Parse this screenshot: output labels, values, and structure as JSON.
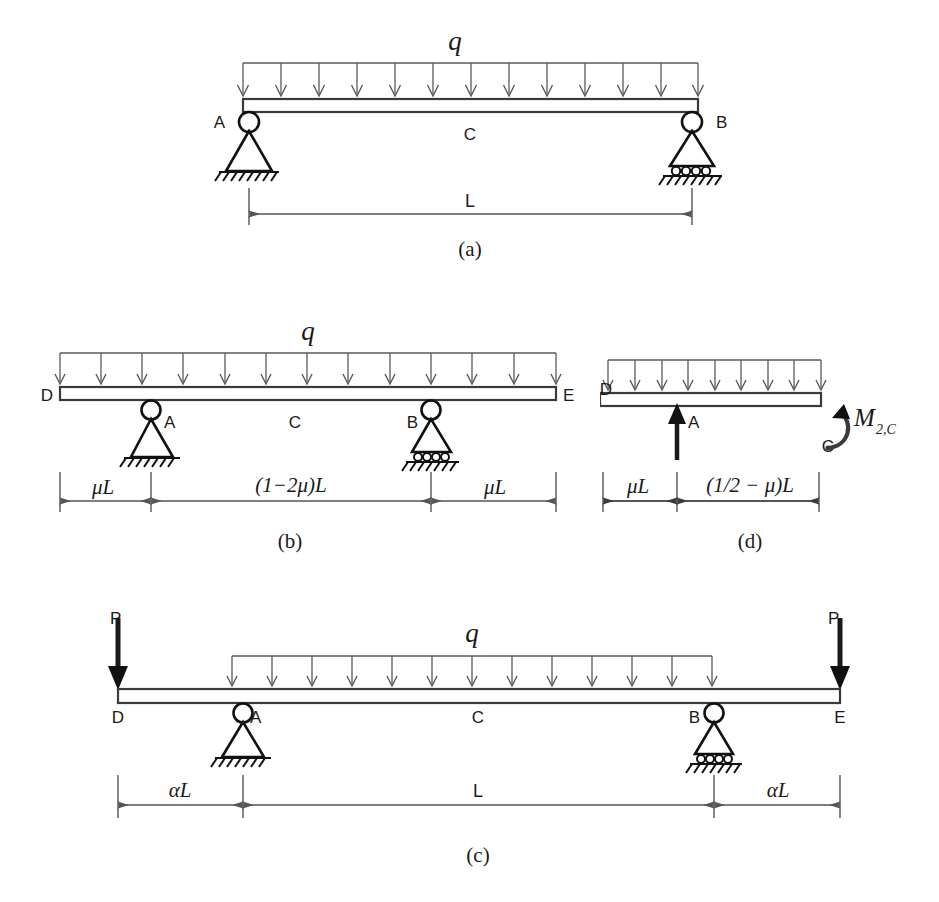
{
  "figure": {
    "background_color": "#ffffff",
    "line_color": "#4a4a4a",
    "dark_color": "#111111"
  },
  "panels": [
    {
      "key": "a",
      "caption": "(a)",
      "description": "Simply supported beam AB with uniformly distributed load q over full span L",
      "load_label": "q",
      "node_labels": {
        "left_support": "A",
        "right_support": "B",
        "midpoint": "C"
      },
      "dimensions": [
        {
          "label": "L",
          "span": "A to B"
        }
      ],
      "supports": [
        {
          "at": "A",
          "type": "pin"
        },
        {
          "at": "B",
          "type": "roller"
        }
      ],
      "load_arrow_count": 13
    },
    {
      "key": "b",
      "caption": "(b)",
      "description": "Overhanging beam DE with supports at A and B, uniformly distributed load q over full length",
      "load_label": "q",
      "node_labels": {
        "left_end": "D",
        "right_end": "E",
        "left_support": "A",
        "right_support": "B",
        "midpoint": "C"
      },
      "dimensions": [
        {
          "label": "μL",
          "span": "D to A"
        },
        {
          "label": "(1−2μ)L",
          "span": "A to B"
        },
        {
          "label": "μL",
          "span": "B to E"
        }
      ],
      "supports": [
        {
          "at": "A",
          "type": "pin"
        },
        {
          "at": "B",
          "type": "roller"
        }
      ],
      "load_arrow_count": 13
    },
    {
      "key": "d",
      "caption": "(d)",
      "description": "Half free-body from D to C with reaction at A and internal moment at C",
      "load_label": "q",
      "node_labels": {
        "left_end": "D",
        "support": "A",
        "cut_section": "C"
      },
      "moment_label": {
        "base": "M",
        "subscript": "2,C",
        "full": "M 2,C"
      },
      "reaction_arrow": {
        "at": "A",
        "direction": "up",
        "label": "A"
      },
      "dimensions": [
        {
          "label": "μL",
          "span": "D to A"
        },
        {
          "label": "(1/2 − μ)L",
          "span": "A to C"
        }
      ],
      "load_arrow_count": 9
    },
    {
      "key": "c",
      "caption": "(c)",
      "description": "Beam DE with point loads P at both overhanging ends and distributed load q between supports A and B",
      "load_label": "q",
      "point_load_label_left": "P",
      "point_load_label_right": "P",
      "node_labels": {
        "left_end": "D",
        "right_end": "E",
        "left_support": "A",
        "right_support": "B",
        "midpoint": "C"
      },
      "dimensions": [
        {
          "label": "αL",
          "span": "D to A"
        },
        {
          "label": "L",
          "span": "A to B"
        },
        {
          "label": "αL",
          "span": "B to E"
        }
      ],
      "supports": [
        {
          "at": "A",
          "type": "pin"
        },
        {
          "at": "B",
          "type": "roller"
        }
      ],
      "load_arrow_count": 13
    }
  ]
}
